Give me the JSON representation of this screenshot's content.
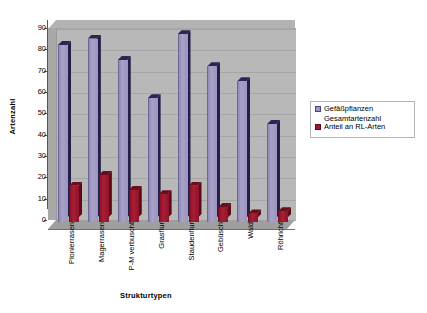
{
  "chart_data": {
    "type": "bar",
    "title": "",
    "xlabel": "Strukturtypen",
    "ylabel": "Artenzahl",
    "categories": [
      "Pionierrasen",
      "Magerrasen",
      "P-M verbuscht",
      "Grasflur",
      "Staudenflur",
      "Gebüsch",
      "Wald",
      "Röhricht"
    ],
    "series": [
      {
        "name": "Gefäßpflanzen Gesamtartenzahl",
        "color": "#9b95c0",
        "values": [
          83,
          86,
          76,
          58,
          88,
          73,
          66,
          46
        ]
      },
      {
        "name": "Anteil an RL-Arten",
        "color": "#9b1b30",
        "values": [
          17,
          22,
          15,
          13,
          17,
          7,
          4,
          5
        ]
      }
    ],
    "ylim": [
      0,
      90
    ],
    "yticks": [
      0,
      10,
      20,
      30,
      40,
      50,
      60,
      70,
      80,
      90
    ],
    "ytick_labels": [
      "0",
      "10",
      "20",
      "30",
      "40",
      "50",
      "60",
      "70",
      "80",
      "90"
    ],
    "grid": true,
    "legend_position": "right",
    "style": "3d-column",
    "plot_background": "#b8b8b8"
  },
  "legend": {
    "entries": [
      {
        "label_line1": "Gefäßpflanzen",
        "label_line2": "Gesamtartenzahl",
        "swatch": "legend-swatch-purple"
      },
      {
        "label_line1": "Anteil an RL-Arten",
        "label_line2": "",
        "swatch": "legend-swatch-red"
      }
    ]
  }
}
